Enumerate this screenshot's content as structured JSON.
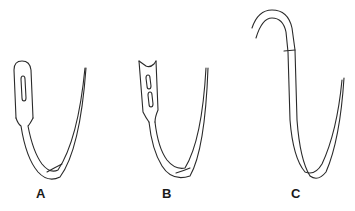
{
  "figure": {
    "needles": [
      {
        "id": "A",
        "label": "A",
        "eye_type": "closed single eye"
      },
      {
        "id": "B",
        "label": "B",
        "eye_type": "french spring eye (forked, two slots)"
      },
      {
        "id": "C",
        "label": "C",
        "eye_type": "swaged / eyeless with attached suture"
      }
    ]
  },
  "colors": {
    "line": "#2a2a2a",
    "background": "#ffffff"
  }
}
